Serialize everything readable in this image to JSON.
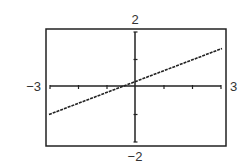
{
  "chart_data": {
    "type": "line",
    "title": "",
    "xlabel": "",
    "ylabel": "",
    "xlim": [
      -3,
      3
    ],
    "ylim": [
      -2,
      2
    ],
    "xscale_ticks": 1,
    "yscale_ticks": 1,
    "grid": false,
    "window_labels": {
      "xmin": "−3",
      "xmax": "3",
      "ymin": "−2",
      "ymax": "2"
    },
    "series": [
      {
        "name": "line",
        "x": [
          -3,
          3
        ],
        "y": [
          -1.0,
          1.4
        ],
        "equation_estimate": "y = 0.4x + 0.2"
      }
    ],
    "colors": {
      "line": "#222222",
      "axes": "#222222",
      "frame": "#222222"
    }
  }
}
